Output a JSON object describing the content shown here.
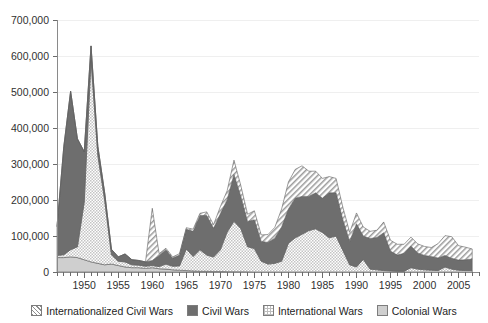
{
  "chart_data": {
    "type": "area",
    "stacked": true,
    "title": "",
    "subtitle": "",
    "xlabel": "",
    "ylabel": "",
    "xlim": [
      1946,
      2008
    ],
    "ylim": [
      0,
      700000
    ],
    "grid": true,
    "legend_position": "bottom",
    "y_ticks": [
      0,
      100000,
      200000,
      300000,
      400000,
      500000,
      600000,
      700000
    ],
    "y_tick_labels": [
      "0",
      "100,000",
      "200,000",
      "300,000",
      "400,000",
      "500,000",
      "600,000",
      "700,000"
    ],
    "x_ticks": [
      1950,
      1955,
      1960,
      1965,
      1970,
      1975,
      1980,
      1985,
      1990,
      1995,
      2000,
      2005
    ],
    "x_tick_labels": [
      "1950",
      "1955",
      "1960",
      "1965",
      "1970",
      "1975",
      "1980",
      "1985",
      "1990",
      "1995",
      "2000",
      "2005"
    ],
    "x_minor_tick_step": 1,
    "x": [
      1946,
      1947,
      1948,
      1949,
      1950,
      1951,
      1952,
      1953,
      1954,
      1955,
      1956,
      1957,
      1958,
      1959,
      1960,
      1961,
      1962,
      1963,
      1964,
      1965,
      1966,
      1967,
      1968,
      1969,
      1970,
      1971,
      1972,
      1973,
      1974,
      1975,
      1976,
      1977,
      1978,
      1979,
      1980,
      1981,
      1982,
      1983,
      1984,
      1985,
      1986,
      1987,
      1988,
      1989,
      1990,
      1991,
      1992,
      1993,
      1994,
      1995,
      1996,
      1997,
      1998,
      1999,
      2000,
      2001,
      2002,
      2003,
      2004,
      2005,
      2006,
      2007
    ],
    "series": [
      {
        "name": "Colonial Wars",
        "pattern": "solid-light",
        "color": "#cfcfcf",
        "values": [
          40000,
          40000,
          42000,
          40000,
          34000,
          28000,
          24000,
          20000,
          22000,
          18000,
          14000,
          12000,
          12000,
          10000,
          12000,
          9000,
          8000,
          6000,
          5000,
          4000,
          3000,
          2000,
          2000,
          1500,
          1500,
          1000,
          800,
          600,
          400,
          0,
          0,
          0,
          0,
          0,
          0,
          0,
          0,
          0,
          0,
          0,
          0,
          0,
          0,
          0,
          0,
          0,
          0,
          0,
          0,
          0,
          0,
          0,
          0,
          0,
          0,
          0,
          0,
          0,
          0,
          0,
          0,
          0
        ]
      },
      {
        "name": "International Wars",
        "pattern": "checker-dots",
        "color": "#dcdcdc",
        "values": [
          6000,
          8000,
          20000,
          30000,
          160000,
          560000,
          300000,
          180000,
          26000,
          12000,
          14000,
          8000,
          7000,
          6000,
          6000,
          6000,
          14000,
          10000,
          12000,
          60000,
          40000,
          60000,
          45000,
          40000,
          60000,
          110000,
          140000,
          120000,
          70000,
          65000,
          30000,
          22000,
          24000,
          30000,
          80000,
          95000,
          105000,
          115000,
          120000,
          110000,
          95000,
          100000,
          60000,
          20000,
          14000,
          35000,
          8000,
          6000,
          4000,
          3000,
          2000,
          2000,
          12000,
          8000,
          6000,
          5000,
          4000,
          14000,
          8000,
          5000,
          4000,
          4000
        ]
      },
      {
        "name": "Civil Wars",
        "pattern": "solid-dark",
        "color": "#6e6e6e",
        "values": [
          80000,
          300000,
          440000,
          300000,
          140000,
          40000,
          25000,
          20000,
          15000,
          12000,
          22000,
          14000,
          13000,
          12000,
          14000,
          30000,
          40000,
          22000,
          30000,
          55000,
          70000,
          95000,
          110000,
          80000,
          100000,
          90000,
          130000,
          90000,
          70000,
          80000,
          55000,
          60000,
          70000,
          95000,
          95000,
          110000,
          105000,
          95000,
          100000,
          95000,
          125000,
          120000,
          85000,
          65000,
          120000,
          65000,
          85000,
          90000,
          105000,
          55000,
          45000,
          50000,
          60000,
          45000,
          40000,
          38000,
          35000,
          32000,
          30000,
          28000,
          30000,
          32000
        ]
      },
      {
        "name": "Internationalized Civil Wars",
        "pattern": "diagonal-hatch",
        "color": "#b5b5b5",
        "values": [
          0,
          0,
          0,
          0,
          0,
          0,
          0,
          0,
          0,
          0,
          0,
          0,
          0,
          0,
          145000,
          6000,
          4000,
          4000,
          4000,
          4000,
          6000,
          6000,
          10000,
          10000,
          20000,
          25000,
          40000,
          30000,
          20000,
          25000,
          18000,
          22000,
          30000,
          50000,
          75000,
          80000,
          85000,
          70000,
          60000,
          55000,
          45000,
          40000,
          35000,
          25000,
          30000,
          25000,
          20000,
          20000,
          30000,
          30000,
          30000,
          25000,
          25000,
          25000,
          25000,
          25000,
          40000,
          55000,
          60000,
          40000,
          35000,
          28000
        ]
      }
    ]
  },
  "legend": {
    "items": [
      {
        "label": "Internationalized Civil Wars",
        "swatch": "diagonal-hatch"
      },
      {
        "label": "Civil Wars",
        "swatch": "solid-dark"
      },
      {
        "label": "International Wars",
        "swatch": "checker-dots"
      },
      {
        "label": "Colonial Wars",
        "swatch": "solid-light"
      }
    ]
  }
}
